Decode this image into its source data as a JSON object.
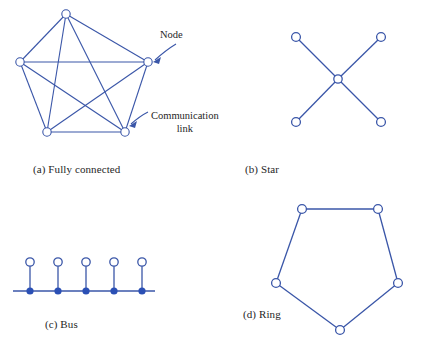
{
  "figure": {
    "width": 427,
    "height": 347,
    "background": "#ffffff",
    "link_color": "#3a56a8",
    "node_stroke": "#3a56a8",
    "node_fill": "#ffffff",
    "tap_fill": "#2b50b5",
    "caption_color": "#262626"
  },
  "annotations": {
    "node_label": "Node",
    "link_label_line1": "Communication",
    "link_label_line2": "link"
  },
  "panels": {
    "a": {
      "caption": "(a) Fully connected",
      "topology": "fully-connected",
      "node_count": 5,
      "link_count": 10,
      "nodes": [
        {
          "id": "a1",
          "x": 66,
          "y": 14
        },
        {
          "id": "a2",
          "x": 20,
          "y": 62
        },
        {
          "id": "a3",
          "x": 148,
          "y": 62
        },
        {
          "id": "a4",
          "x": 47,
          "y": 132
        },
        {
          "id": "a5",
          "x": 125,
          "y": 132
        }
      ],
      "links": [
        [
          "a1",
          "a2"
        ],
        [
          "a1",
          "a3"
        ],
        [
          "a1",
          "a4"
        ],
        [
          "a1",
          "a5"
        ],
        [
          "a2",
          "a3"
        ],
        [
          "a2",
          "a4"
        ],
        [
          "a2",
          "a5"
        ],
        [
          "a3",
          "a4"
        ],
        [
          "a3",
          "a5"
        ],
        [
          "a4",
          "a5"
        ]
      ]
    },
    "b": {
      "caption": "(b) Star",
      "topology": "star",
      "node_count": 5,
      "link_count": 4,
      "hub": {
        "id": "b0",
        "x": 338,
        "y": 79
      },
      "nodes": [
        {
          "id": "b1",
          "x": 296,
          "y": 37
        },
        {
          "id": "b2",
          "x": 381,
          "y": 37
        },
        {
          "id": "b3",
          "x": 296,
          "y": 122
        },
        {
          "id": "b4",
          "x": 381,
          "y": 122
        }
      ],
      "links": [
        [
          "b0",
          "b1"
        ],
        [
          "b0",
          "b2"
        ],
        [
          "b0",
          "b3"
        ],
        [
          "b0",
          "b4"
        ]
      ]
    },
    "c": {
      "caption": "(c) Bus",
      "topology": "bus",
      "node_count": 5,
      "bus_line": {
        "x1": 13,
        "x2": 155,
        "y": 291
      },
      "stem_top_y": 262,
      "nodes": [
        {
          "id": "c1",
          "x": 30,
          "y": 262
        },
        {
          "id": "c2",
          "x": 58,
          "y": 262
        },
        {
          "id": "c3",
          "x": 86,
          "y": 262
        },
        {
          "id": "c4",
          "x": 114,
          "y": 262
        },
        {
          "id": "c5",
          "x": 142,
          "y": 262
        }
      ],
      "taps": [
        {
          "x": 30,
          "y": 291
        },
        {
          "x": 58,
          "y": 291
        },
        {
          "x": 86,
          "y": 291
        },
        {
          "x": 114,
          "y": 291
        },
        {
          "x": 142,
          "y": 291
        }
      ]
    },
    "d": {
      "caption": "(d) Ring",
      "topology": "ring",
      "node_count": 5,
      "link_count": 5,
      "nodes": [
        {
          "id": "d1",
          "x": 302,
          "y": 209
        },
        {
          "id": "d2",
          "x": 378,
          "y": 209
        },
        {
          "id": "d3",
          "x": 398,
          "y": 283
        },
        {
          "id": "d4",
          "x": 340,
          "y": 330
        },
        {
          "id": "d5",
          "x": 276,
          "y": 283
        }
      ],
      "links": [
        [
          "d1",
          "d2"
        ],
        [
          "d2",
          "d3"
        ],
        [
          "d3",
          "d4"
        ],
        [
          "d4",
          "d5"
        ],
        [
          "d5",
          "d1"
        ]
      ]
    }
  }
}
